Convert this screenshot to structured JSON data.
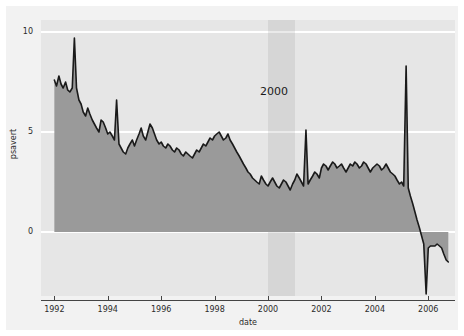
{
  "chart_data": {
    "type": "area",
    "title": "",
    "subtitle": "",
    "xlabel": "date",
    "ylabel": "psavert",
    "xlim": [
      1991.5,
      2007.0
    ],
    "ylim": [
      -3.2,
      10.6
    ],
    "grid": true,
    "gridlines_y": [
      0,
      5,
      10
    ],
    "legend": null,
    "legend_position": "none",
    "xticks": [
      "1992",
      "1994",
      "1996",
      "1998",
      "2000",
      "2002",
      "2004",
      "2006"
    ],
    "xtick_values": [
      1992,
      1994,
      1996,
      1998,
      2000,
      2002,
      2004,
      2006
    ],
    "yticks": [
      "0",
      "5",
      "10"
    ],
    "ytick_values": [
      0,
      5,
      10
    ],
    "annotations": [
      {
        "text": "2000",
        "type": "band-label",
        "x": 2000.3,
        "y": 7.0
      }
    ],
    "highlight_bands": [
      {
        "label": "2000",
        "x_start": 2000.0,
        "x_end": 2001.0,
        "color": "#a0a0a0",
        "opacity": 0.22
      }
    ],
    "series": [
      {
        "name": "psavert",
        "type": "area",
        "line_color": "#1a1a1a",
        "fill_color": "#9a9a9a",
        "baseline": 0,
        "x": [
          1992.0,
          1992.08,
          1992.17,
          1992.25,
          1992.33,
          1992.42,
          1992.5,
          1992.58,
          1992.67,
          1992.75,
          1992.83,
          1992.92,
          1993.0,
          1993.08,
          1993.17,
          1993.25,
          1993.33,
          1993.42,
          1993.5,
          1993.58,
          1993.67,
          1993.75,
          1993.83,
          1993.92,
          1994.0,
          1994.08,
          1994.17,
          1994.25,
          1994.33,
          1994.42,
          1994.5,
          1994.58,
          1994.67,
          1994.75,
          1994.83,
          1994.92,
          1995.0,
          1995.08,
          1995.17,
          1995.25,
          1995.33,
          1995.42,
          1995.5,
          1995.58,
          1995.67,
          1995.75,
          1995.83,
          1995.92,
          1996.0,
          1996.08,
          1996.17,
          1996.25,
          1996.33,
          1996.42,
          1996.5,
          1996.58,
          1996.67,
          1996.75,
          1996.83,
          1996.92,
          1997.0,
          1997.08,
          1997.17,
          1997.25,
          1997.33,
          1997.42,
          1997.5,
          1997.58,
          1997.67,
          1997.75,
          1997.83,
          1997.92,
          1998.0,
          1998.08,
          1998.17,
          1998.25,
          1998.33,
          1998.42,
          1998.5,
          1998.58,
          1998.67,
          1998.75,
          1998.83,
          1998.92,
          1999.0,
          1999.08,
          1999.17,
          1999.25,
          1999.33,
          1999.42,
          1999.5,
          1999.58,
          1999.67,
          1999.75,
          1999.83,
          1999.92,
          2000.0,
          2000.08,
          2000.17,
          2000.25,
          2000.33,
          2000.42,
          2000.5,
          2000.58,
          2000.67,
          2000.75,
          2000.83,
          2000.92,
          2001.0,
          2001.08,
          2001.17,
          2001.25,
          2001.33,
          2001.42,
          2001.5,
          2001.58,
          2001.67,
          2001.75,
          2001.83,
          2001.92,
          2002.0,
          2002.08,
          2002.17,
          2002.25,
          2002.33,
          2002.42,
          2002.5,
          2002.58,
          2002.67,
          2002.75,
          2002.83,
          2002.92,
          2003.0,
          2003.08,
          2003.17,
          2003.25,
          2003.33,
          2003.42,
          2003.5,
          2003.58,
          2003.67,
          2003.75,
          2003.83,
          2003.92,
          2004.0,
          2004.08,
          2004.17,
          2004.25,
          2004.33,
          2004.42,
          2004.5,
          2004.58,
          2004.67,
          2004.75,
          2004.83,
          2004.92,
          2005.0,
          2005.08,
          2005.17,
          2005.25,
          2005.33,
          2005.42,
          2005.5,
          2005.58,
          2005.67,
          2005.75,
          2005.83,
          2005.92,
          2006.0,
          2006.08,
          2006.17,
          2006.25,
          2006.33,
          2006.42,
          2006.5,
          2006.58,
          2006.67,
          2006.75
        ],
        "y": [
          7.6,
          7.3,
          7.8,
          7.4,
          7.2,
          7.5,
          7.1,
          7.0,
          7.2,
          9.7,
          7.2,
          6.6,
          6.4,
          6.0,
          5.8,
          6.2,
          5.9,
          5.6,
          5.4,
          5.2,
          5.0,
          5.6,
          5.5,
          5.2,
          4.9,
          5.0,
          4.8,
          4.6,
          6.6,
          4.4,
          4.2,
          4.0,
          3.9,
          4.2,
          4.4,
          4.6,
          4.3,
          4.6,
          4.9,
          5.2,
          4.8,
          4.6,
          5.0,
          5.4,
          5.2,
          4.9,
          4.6,
          4.4,
          4.5,
          4.3,
          4.2,
          4.4,
          4.3,
          4.1,
          4.0,
          4.2,
          4.1,
          3.9,
          3.8,
          4.0,
          3.9,
          3.8,
          3.7,
          3.9,
          4.1,
          4.0,
          4.2,
          4.4,
          4.3,
          4.5,
          4.7,
          4.6,
          4.8,
          4.9,
          5.0,
          4.8,
          4.6,
          4.7,
          4.9,
          4.6,
          4.4,
          4.2,
          4.0,
          3.8,
          3.6,
          3.4,
          3.2,
          3.0,
          2.9,
          2.7,
          2.6,
          2.5,
          2.4,
          2.8,
          2.6,
          2.4,
          2.3,
          2.5,
          2.7,
          2.5,
          2.3,
          2.2,
          2.4,
          2.6,
          2.5,
          2.3,
          2.1,
          2.4,
          2.6,
          2.9,
          2.7,
          2.5,
          2.3,
          5.1,
          2.4,
          2.6,
          2.8,
          3.0,
          2.9,
          2.7,
          3.2,
          3.4,
          3.3,
          3.1,
          3.3,
          3.5,
          3.4,
          3.2,
          3.3,
          3.4,
          3.2,
          3.0,
          3.2,
          3.4,
          3.3,
          3.5,
          3.4,
          3.2,
          3.3,
          3.5,
          3.4,
          3.2,
          3.0,
          3.2,
          3.3,
          3.4,
          3.3,
          3.1,
          3.2,
          3.4,
          3.2,
          3.0,
          2.9,
          2.8,
          2.6,
          2.4,
          2.5,
          2.3,
          8.3,
          2.2,
          1.8,
          1.4,
          1.0,
          0.6,
          0.2,
          -0.2,
          -0.6,
          -3.1,
          -0.8,
          -0.7,
          -0.7,
          -0.7,
          -0.6,
          -0.7,
          -0.8,
          -1.1,
          -1.4,
          -1.5
        ]
      }
    ]
  },
  "axes": {
    "y_title": "psavert",
    "x_title": "date"
  },
  "colors": {
    "panel_background": "#e6e6e6",
    "figure_background": "#f2f2f2",
    "gridline": "#ffffff",
    "area_fill": "#9a9a9a",
    "line": "#1a1a1a",
    "band_fill": "#a0a0a0",
    "tick_text": "#2b2b2b",
    "axis_line": "#444444"
  }
}
